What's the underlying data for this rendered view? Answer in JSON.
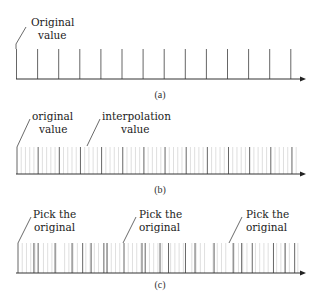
{
  "panels": [
    {
      "id": "a",
      "caption": "(a)",
      "labels": [
        {
          "lines": [
            "Original",
            "value"
          ]
        }
      ],
      "major_ticks": [
        0,
        1,
        2,
        3,
        4,
        5,
        6,
        7,
        8,
        9,
        10,
        11,
        12,
        13
      ],
      "minor_per_interval": 0,
      "description": "Original samples only"
    },
    {
      "id": "b",
      "caption": "(b)",
      "labels": [
        {
          "lines": [
            "original",
            "value"
          ]
        },
        {
          "lines": [
            "interpolation",
            "value"
          ]
        }
      ],
      "major_ticks": [
        0,
        1,
        2,
        3,
        4,
        5,
        6,
        7,
        8,
        9,
        10,
        11,
        12,
        13
      ],
      "minor_per_interval": 4,
      "description": "Original samples with interpolated values in between"
    },
    {
      "id": "c",
      "caption": "(c)",
      "labels": [
        {
          "lines": [
            "Pick the",
            "original"
          ]
        },
        {
          "lines": [
            "Pick the",
            "original"
          ]
        },
        {
          "lines": [
            "Pick the",
            "original"
          ]
        }
      ],
      "picked_ticks": [
        0,
        0.75,
        0.95,
        1.75,
        2.55,
        3.05,
        3.45,
        4.05,
        4.2,
        5.0,
        5.85,
        6.0,
        6.7,
        7.1,
        7.9,
        8.35,
        9.25,
        10.15,
        10.55,
        11.05,
        12.05,
        12.6,
        13.05
      ],
      "minor_per_interval": 4,
      "description": "Re-sampled values picked from the interpolated sequence"
    }
  ]
}
